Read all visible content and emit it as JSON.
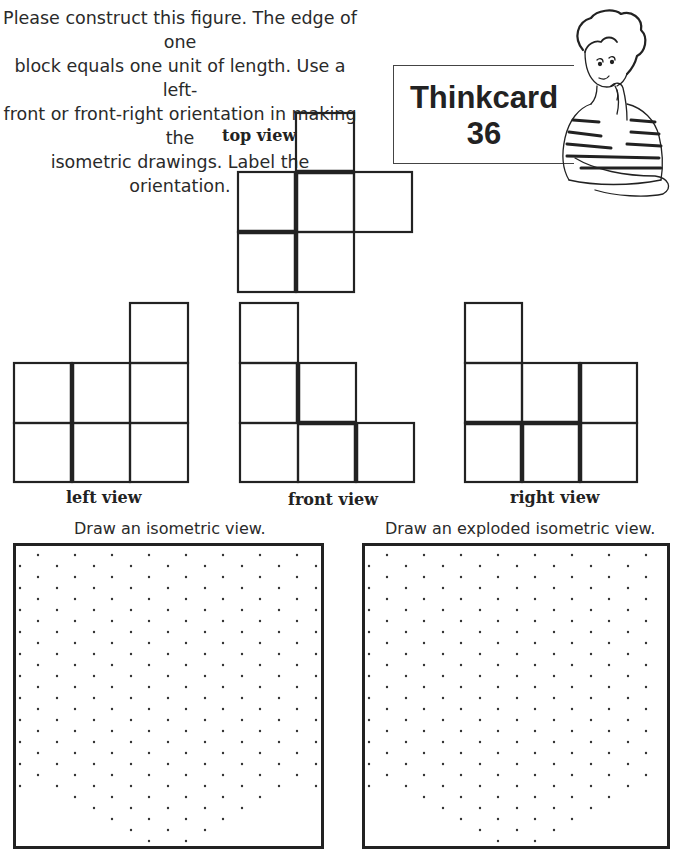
{
  "instructions": {
    "line1": "Please construct this figure. The edge of one",
    "line2": "block equals one unit of length. Use a left-",
    "line3": "front or front-right orientation in making the",
    "line4": "isometric drawings. Label the orientation."
  },
  "card": {
    "title": "Thinkcard",
    "number": "36",
    "illustration": "thinking-student-icon"
  },
  "views": {
    "top": {
      "label": "top view"
    },
    "left": {
      "label": "left view"
    },
    "front": {
      "label": "front view"
    },
    "right": {
      "label": "right view"
    }
  },
  "drawing_areas": {
    "isometric": {
      "prompt": "Draw an isometric view."
    },
    "exploded": {
      "prompt": "Draw an exploded isometric view."
    }
  },
  "colors": {
    "ink": "#222222",
    "background": "#ffffff"
  }
}
